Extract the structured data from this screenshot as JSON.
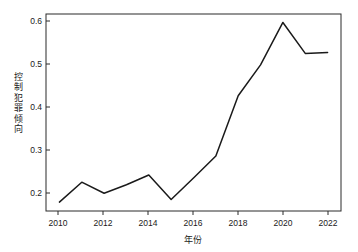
{
  "chart_data": {
    "type": "line",
    "title": "",
    "xlabel": "年份",
    "ylabel": "控制犯罪倾向",
    "x": [
      2010,
      2011,
      2012,
      2013,
      2014,
      2015,
      2016,
      2017,
      2018,
      2019,
      2020,
      2021,
      2022
    ],
    "values": [
      0.181,
      0.228,
      0.202,
      0.222,
      0.245,
      0.187,
      0.238,
      0.29,
      0.432,
      0.505,
      0.605,
      0.532,
      0.534
    ],
    "series": [
      {
        "name": "控制犯罪倾向",
        "values": [
          0.181,
          0.228,
          0.202,
          0.222,
          0.245,
          0.187,
          0.238,
          0.29,
          0.432,
          0.505,
          0.605,
          0.532,
          0.534
        ]
      }
    ],
    "xticks": [
      2010,
      2012,
      2014,
      2016,
      2018,
      2020,
      2022
    ],
    "xtick_labels": [
      "2010",
      "2012",
      "2014",
      "2016",
      "2018",
      "2020",
      "2022"
    ],
    "yticks": [
      0.2,
      0.3,
      0.4,
      0.5,
      0.6
    ],
    "ytick_labels": [
      "0.2",
      "0.3",
      "0.4",
      "0.5",
      "0.6"
    ],
    "xlim": [
      2009.4,
      2022.6
    ],
    "ylim": [
      0.16,
      0.625
    ],
    "grid": false,
    "legend": null,
    "line_color": "#1a1a1a",
    "background_color": "#ffffff"
  },
  "axes": {
    "x_title": "年份",
    "y_title_chars": [
      "控",
      "制",
      "犯",
      "罪",
      "倾",
      "向"
    ],
    "x_tick_labels": [
      "2010",
      "2012",
      "2014",
      "2016",
      "2018",
      "2020",
      "2022"
    ],
    "y_tick_labels": [
      "0.6",
      "0.5",
      "0.4",
      "0.3",
      "0.2"
    ]
  }
}
